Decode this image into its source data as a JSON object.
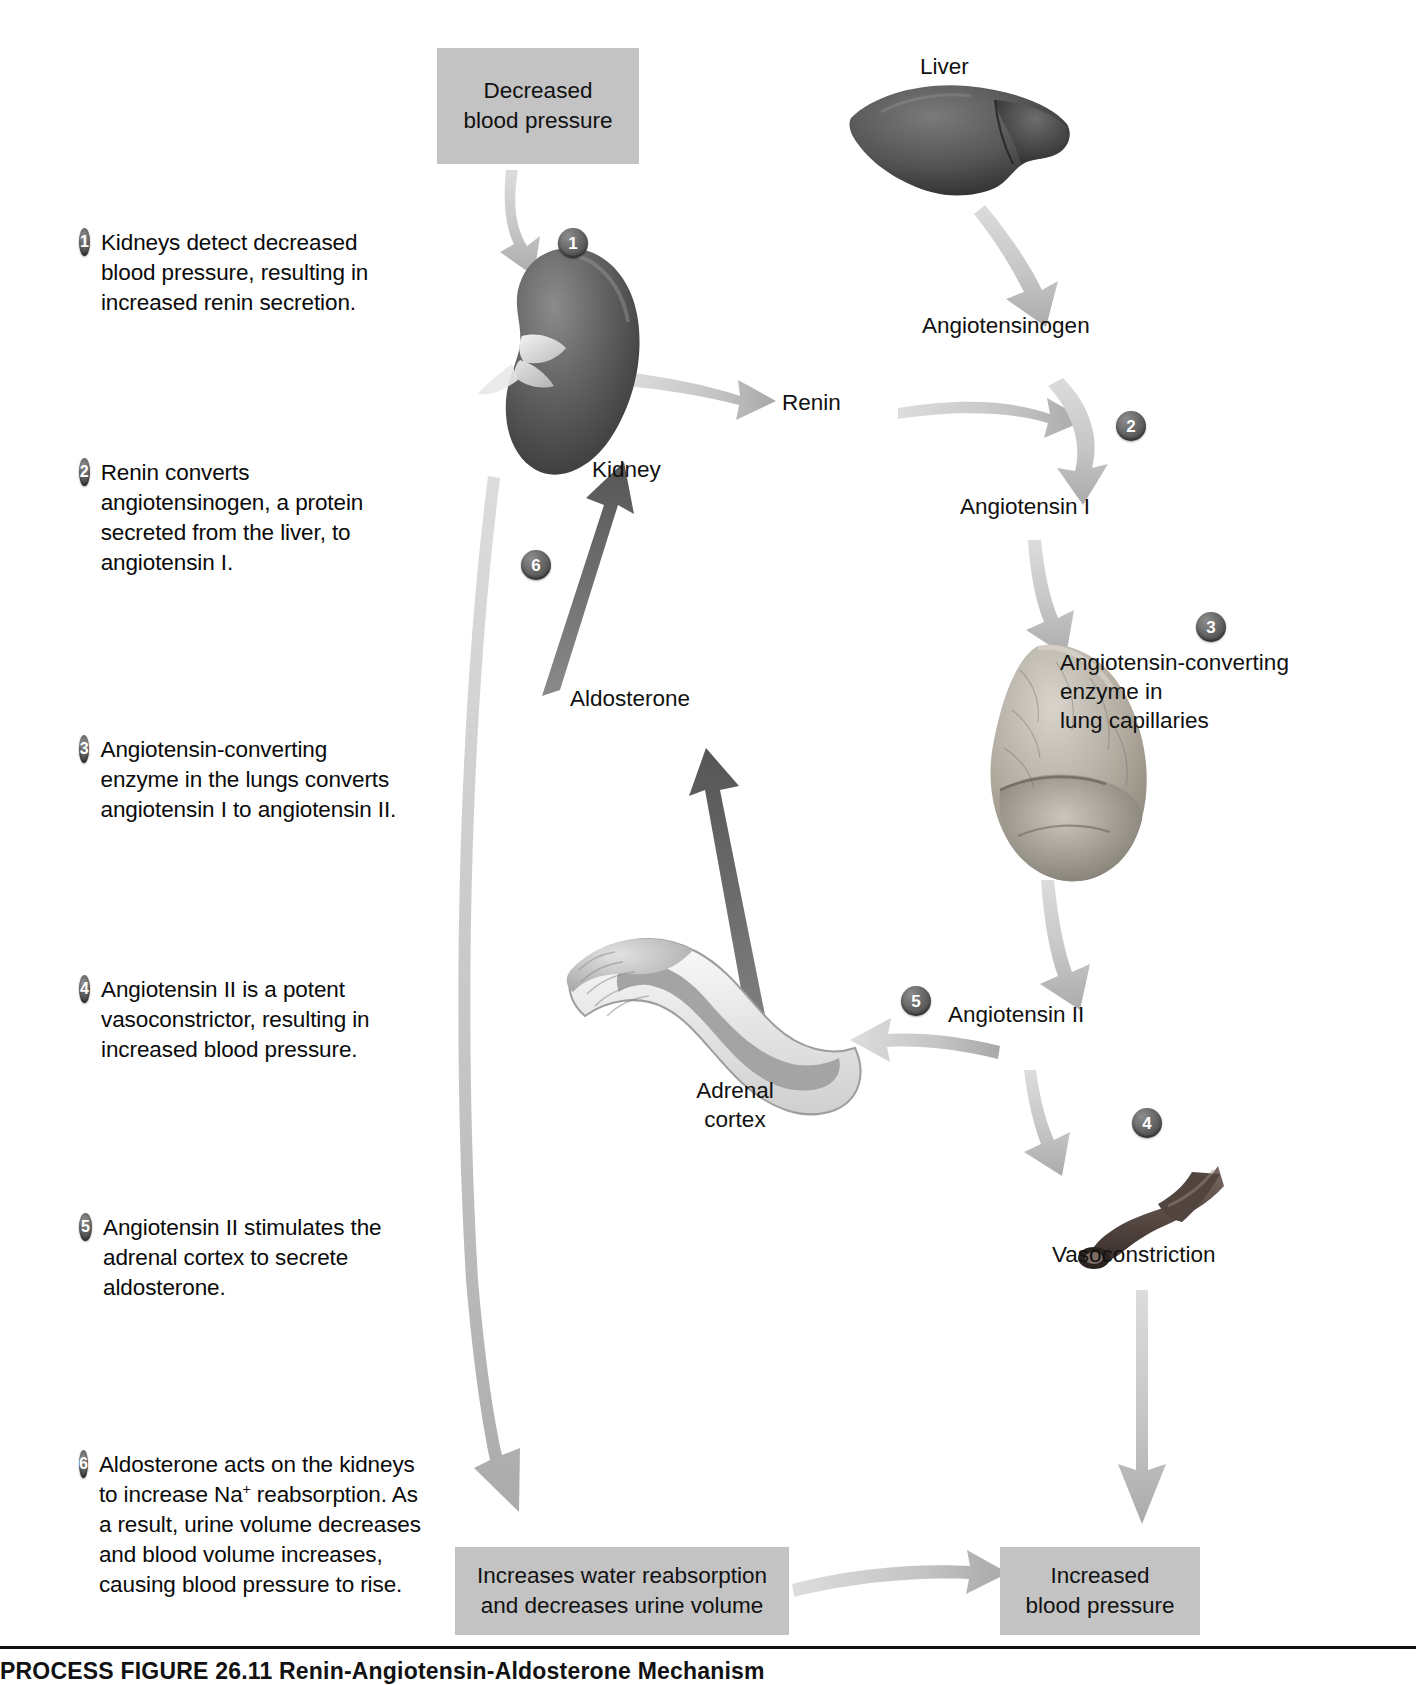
{
  "figure": {
    "caption_label": "PROCESS FIGURE 26.11",
    "caption_title": "Renin-Angiotensin-Aldosterone Mechanism"
  },
  "legend": {
    "items": [
      {
        "number": "1",
        "text": "Kidneys detect decreased blood pressure, resulting in increased renin secretion."
      },
      {
        "number": "2",
        "text": "Renin converts angiotensinogen, a protein secreted from the liver, to angiotensin I."
      },
      {
        "number": "3",
        "text": "Angiotensin-converting enzyme in the lungs converts angiotensin I to angiotensin II."
      },
      {
        "number": "4",
        "text": "Angiotensin II is a potent vasoconstrictor, resulting in increased blood pressure."
      },
      {
        "number": "5",
        "text": "Angiotensin II stimulates the adrenal cortex to secrete aldosterone."
      },
      {
        "number": "6",
        "text_before_sup": "Aldosterone acts on the kidneys to increase Na",
        "sup": "+",
        "text_after_sup": " reabsorption. As a result, urine volume decreases and blood volume increases, causing blood pressure to rise."
      }
    ]
  },
  "diagram": {
    "boxes": {
      "decreased_bp": "Decreased\nblood pressure",
      "decreased_bp_line1": "Decreased",
      "decreased_bp_line2": "blood pressure",
      "water_reabsorption_line1": "Increases water reabsorption",
      "water_reabsorption_line2": "and decreases urine volume",
      "increased_bp_line1": "Increased",
      "increased_bp_line2": "blood pressure"
    },
    "labels": {
      "liver": "Liver",
      "kidney": "Kidney",
      "renin": "Renin",
      "angiotensinogen": "Angiotensinogen",
      "angiotensin_i": "Angiotensin I",
      "ace_line1": "Angiotensin-converting",
      "ace_line2": "enzyme in",
      "ace_line3": "lung capillaries",
      "angiotensin_ii": "Angiotensin II",
      "aldosterone": "Aldosterone",
      "adrenal_line1": "Adrenal",
      "adrenal_line2": "cortex",
      "vasoconstriction": "Vasoconstriction"
    },
    "step_markers": [
      "1",
      "2",
      "3",
      "4",
      "5",
      "6"
    ],
    "colors": {
      "box_fill": "#c3c3c3",
      "arrow_grey": "#c9c9c9",
      "arrow_dark": "#6b6b6b",
      "badge_dark": "#4a4a4a",
      "text": "#111111"
    }
  }
}
